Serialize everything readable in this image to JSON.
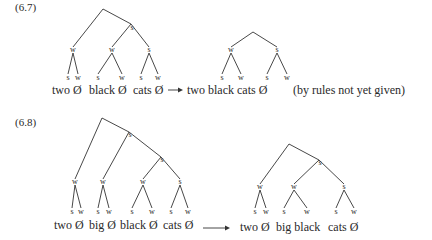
{
  "examples": [
    {
      "id": "6.7",
      "label": "(6.7)",
      "label_pos": [
        15,
        2
      ],
      "input_tree": {
        "edges": [
          [
            103,
            9,
            73,
            47
          ],
          [
            103,
            9,
            131,
            24
          ],
          [
            131,
            24,
            112,
            47
          ],
          [
            131,
            24,
            149,
            47
          ],
          [
            73,
            53,
            68,
            74
          ],
          [
            73,
            53,
            78,
            74
          ],
          [
            112,
            53,
            98,
            74
          ],
          [
            112,
            53,
            122,
            74
          ],
          [
            149,
            53,
            141,
            74
          ],
          [
            149,
            53,
            158,
            74
          ]
        ],
        "nodes": [
          {
            "t": "s",
            "x": 132,
            "y": 28
          },
          {
            "t": "w",
            "x": 73,
            "y": 50
          },
          {
            "t": "w",
            "x": 112,
            "y": 50
          },
          {
            "t": "s",
            "x": 149,
            "y": 50
          },
          {
            "t": "s",
            "x": 68,
            "y": 78
          },
          {
            "t": "w",
            "x": 78,
            "y": 78
          },
          {
            "t": "s",
            "x": 98,
            "y": 78
          },
          {
            "t": "w",
            "x": 122,
            "y": 78
          },
          {
            "t": "s",
            "x": 141,
            "y": 78
          },
          {
            "t": "w",
            "x": 158,
            "y": 78
          }
        ],
        "words": [
          {
            "t": "two Ø",
            "x": 52,
            "y": 84
          },
          {
            "t": "black Ø",
            "x": 89,
            "y": 84
          },
          {
            "t": "cats Ø",
            "x": 133,
            "y": 84
          }
        ]
      },
      "arrow": {
        "x1": 168,
        "y1": 90,
        "x2": 183,
        "y2": 90
      },
      "output_tree": {
        "edges": [
          [
            253,
            32,
            231,
            47
          ],
          [
            253,
            32,
            277,
            47
          ],
          [
            231,
            53,
            222,
            74
          ],
          [
            231,
            53,
            241,
            74
          ],
          [
            277,
            53,
            267,
            74
          ],
          [
            277,
            53,
            287,
            74
          ]
        ],
        "nodes": [
          {
            "t": "w",
            "x": 231,
            "y": 50
          },
          {
            "t": "s",
            "x": 277,
            "y": 50
          },
          {
            "t": "s",
            "x": 222,
            "y": 78
          },
          {
            "t": "w",
            "x": 241,
            "y": 78
          },
          {
            "t": "s",
            "x": 267,
            "y": 78
          },
          {
            "t": "w",
            "x": 287,
            "y": 78
          }
        ],
        "words": [
          {
            "t": "two black cats Ø",
            "x": 187,
            "y": 84
          }
        ]
      },
      "note": {
        "t": "(by rules not yet given)",
        "x": 293,
        "y": 84
      }
    },
    {
      "id": "6.8",
      "label": "(6.8)",
      "label_pos": [
        15,
        117
      ],
      "input_tree": {
        "edges": [
          [
            102,
            118,
            75,
            179
          ],
          [
            102,
            118,
            129,
            132
          ],
          [
            129,
            132,
            103,
            179
          ],
          [
            129,
            132,
            161,
            157
          ],
          [
            161,
            157,
            143,
            179
          ],
          [
            161,
            157,
            180,
            179
          ],
          [
            75,
            185,
            72,
            208
          ],
          [
            75,
            185,
            81,
            208
          ],
          [
            103,
            185,
            98,
            208
          ],
          [
            103,
            185,
            109,
            208
          ],
          [
            143,
            185,
            132,
            208
          ],
          [
            143,
            185,
            152,
            208
          ],
          [
            180,
            185,
            171,
            208
          ],
          [
            180,
            185,
            188,
            208
          ]
        ],
        "nodes": [
          {
            "t": "s",
            "x": 130,
            "y": 135
          },
          {
            "t": "s",
            "x": 162,
            "y": 160
          },
          {
            "t": "w",
            "x": 75,
            "y": 182
          },
          {
            "t": "w",
            "x": 103,
            "y": 182
          },
          {
            "t": "w",
            "x": 143,
            "y": 182
          },
          {
            "t": "s",
            "x": 180,
            "y": 182
          },
          {
            "t": "s",
            "x": 72,
            "y": 212
          },
          {
            "t": "w",
            "x": 81,
            "y": 212
          },
          {
            "t": "s",
            "x": 98,
            "y": 212
          },
          {
            "t": "w",
            "x": 109,
            "y": 212
          },
          {
            "t": "s",
            "x": 132,
            "y": 212
          },
          {
            "t": "w",
            "x": 152,
            "y": 212
          },
          {
            "t": "s",
            "x": 171,
            "y": 212
          },
          {
            "t": "w",
            "x": 188,
            "y": 212
          }
        ],
        "words": [
          {
            "t": "two Ø",
            "x": 54,
            "y": 219
          },
          {
            "t": "big Ø",
            "x": 89,
            "y": 219
          },
          {
            "t": "black Ø",
            "x": 120,
            "y": 219
          },
          {
            "t": "cats Ø",
            "x": 163,
            "y": 219
          }
        ]
      },
      "arrow": {
        "x1": 203,
        "y1": 228,
        "x2": 230,
        "y2": 228
      },
      "output_tree": {
        "edges": [
          [
            289,
            144,
            260,
            184
          ],
          [
            289,
            144,
            319,
            160
          ],
          [
            319,
            160,
            294,
            184
          ],
          [
            319,
            160,
            344,
            184
          ],
          [
            260,
            190,
            255,
            208
          ],
          [
            260,
            190,
            266,
            208
          ],
          [
            294,
            190,
            284,
            208
          ],
          [
            294,
            190,
            307,
            208
          ],
          [
            344,
            190,
            336,
            208
          ],
          [
            344,
            190,
            354,
            208
          ]
        ],
        "nodes": [
          {
            "t": "s",
            "x": 320,
            "y": 163
          },
          {
            "t": "w",
            "x": 260,
            "y": 187
          },
          {
            "t": "w",
            "x": 294,
            "y": 187
          },
          {
            "t": "s",
            "x": 344,
            "y": 187
          },
          {
            "t": "s",
            "x": 255,
            "y": 212
          },
          {
            "t": "w",
            "x": 266,
            "y": 212
          },
          {
            "t": "s",
            "x": 284,
            "y": 212
          },
          {
            "t": "w",
            "x": 307,
            "y": 212
          },
          {
            "t": "s",
            "x": 336,
            "y": 212
          },
          {
            "t": "w",
            "x": 354,
            "y": 212
          }
        ],
        "words": [
          {
            "t": "two Ø",
            "x": 240,
            "y": 221
          },
          {
            "t": "big black",
            "x": 276,
            "y": 221
          },
          {
            "t": "cats Ø",
            "x": 328,
            "y": 221
          }
        ]
      }
    }
  ]
}
